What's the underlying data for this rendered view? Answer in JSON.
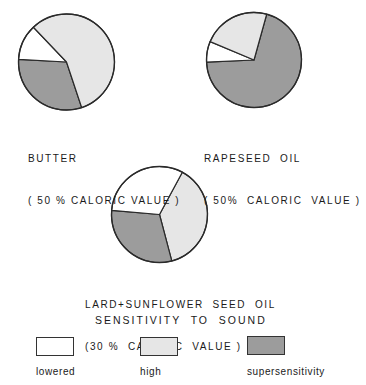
{
  "chart_data": [
    {
      "type": "pie",
      "title": "BUTTER",
      "subtitle": "(50% CALORIC VALUE)",
      "categories": [
        "lowered",
        "high",
        "supersensitivity"
      ],
      "values": [
        12,
        57,
        31
      ],
      "units": "%"
    },
    {
      "type": "pie",
      "title": "RAPESEED OIL",
      "subtitle": "(50% CALORIC VALUE)",
      "categories": [
        "lowered",
        "high",
        "supersensitivity"
      ],
      "values": [
        7,
        23,
        70
      ],
      "units": "%"
    },
    {
      "type": "pie",
      "title": "LARD+SUNFLOWER SEED OIL",
      "subtitle": "(30% CALORIC VALUE)",
      "categories": [
        "lowered",
        "high",
        "supersensitivity"
      ],
      "values": [
        31.5,
        38,
        30.5
      ],
      "units": "%"
    }
  ],
  "pies": [
    {
      "cx": 66.5,
      "cy": 62,
      "r": 48,
      "start_deg": 161.6,
      "order": [
        "supersensitivity",
        "lowered",
        "high"
      ],
      "values": {
        "supersensitivity": 31,
        "lowered": 12,
        "high": 57
      }
    },
    {
      "cx": 254,
      "cy": 60,
      "r": 47.5,
      "start_deg": 15.5,
      "order": [
        "supersensitivity",
        "lowered",
        "high"
      ],
      "values": {
        "supersensitivity": 70,
        "lowered": 7,
        "high": 23
      }
    },
    {
      "cx": 159.5,
      "cy": 214.5,
      "r": 48,
      "start_deg": 28.4,
      "order": [
        "high",
        "supersensitivity",
        "lowered"
      ],
      "values": {
        "high": 38,
        "supersensitivity": 30.5,
        "lowered": 31.5
      }
    }
  ],
  "captions": {
    "butter": {
      "line1": "BUTTER",
      "line2": "( 50 % CALORIC VALUE )"
    },
    "rapeseed": {
      "line1": "RAPESEED  OIL",
      "line2": "( 50%  CALORIC  VALUE )"
    },
    "lard": {
      "line1": "LARD+SUNFLOWER  SEED  OIL",
      "line2": "(30 %  CALORIC  VALUE )"
    }
  },
  "legend": {
    "title": "SENSITIVITY  TO  SOUND",
    "items": [
      {
        "key": "lowered",
        "label": "lowered",
        "color": "#ffffff"
      },
      {
        "key": "high",
        "label": "high",
        "color": "#e6e6e6"
      },
      {
        "key": "supersensitivity",
        "label": "supersensitivity",
        "color": "#9c9c9c"
      }
    ]
  },
  "colors": {
    "lowered": "#ffffff",
    "high": "#e6e6e6",
    "supersensitivity": "#9c9c9c",
    "stroke": "#2a2a2a"
  }
}
